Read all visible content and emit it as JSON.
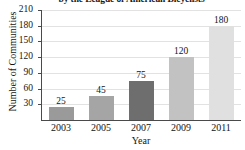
{
  "chart_data": {
    "type": "bar",
    "title": "by the League of American Bicyclists",
    "xlabel": "Year",
    "ylabel": "Number of Communities",
    "categories": [
      "2003",
      "2005",
      "2007",
      "2009",
      "2011"
    ],
    "values": [
      25,
      45,
      75,
      120,
      180
    ],
    "value_labels": [
      "25",
      "45",
      "75",
      "120",
      "180"
    ],
    "ylim": [
      0,
      210
    ],
    "yticks": [
      30,
      60,
      90,
      120,
      150,
      180,
      210
    ],
    "ytick_labels": [
      "30",
      "60",
      "90",
      "120",
      "150",
      "180",
      "210"
    ],
    "grid": true,
    "legend": "none",
    "bar_colors": [
      "#9a9a9a",
      "#a5a5a5",
      "#6e6e6e",
      "#c2c2c2",
      "#e0e0e0"
    ],
    "axis_color": "#4a4a4a",
    "grid_color": "#e2e2e2",
    "background": "#ffffff"
  }
}
